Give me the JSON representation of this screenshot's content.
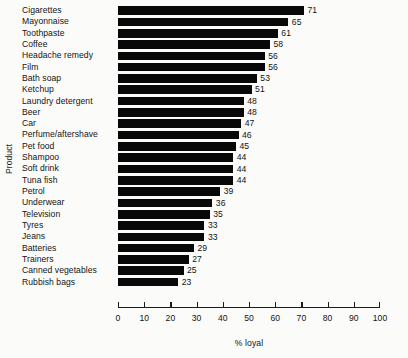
{
  "chart_data": {
    "type": "bar",
    "orientation": "horizontal",
    "title": "",
    "xlabel": "% loyal",
    "ylabel": "Product",
    "xlim": [
      0,
      100
    ],
    "xticks": [
      0,
      10,
      20,
      30,
      40,
      50,
      60,
      70,
      80,
      90,
      100
    ],
    "grid": false,
    "legend": null,
    "bar_color": "#080808",
    "background_color": "#fbfbfa",
    "categories": [
      "Cigarettes",
      "Mayonnaise",
      "Toothpaste",
      "Coffee",
      "Headache remedy",
      "Film",
      "Bath soap",
      "Ketchup",
      "Laundry detergent",
      "Beer",
      "Car",
      "Perfume/aftershave",
      "Pet food",
      "Shampoo",
      "Soft drink",
      "Tuna fish",
      "Petrol",
      "Underwear",
      "Television",
      "Tyres",
      "Jeans",
      "Batteries",
      "Trainers",
      "Canned vegetables",
      "Rubbish bags"
    ],
    "values": [
      71,
      65,
      61,
      58,
      56,
      56,
      53,
      51,
      48,
      48,
      47,
      46,
      45,
      44,
      44,
      44,
      39,
      36,
      35,
      33,
      33,
      29,
      27,
      25,
      23
    ],
    "value_labels": [
      "71",
      "65",
      "61",
      "58",
      "56",
      "56",
      "53",
      "51",
      "48",
      "48",
      "47",
      "46",
      "45",
      "44",
      "44",
      "44",
      "39",
      "36",
      "35",
      "33",
      "33",
      "29",
      "27",
      "25",
      "23"
    ],
    "xtick_labels": [
      "0",
      "10",
      "20",
      "30",
      "40",
      "50",
      "60",
      "70",
      "80",
      "90",
      "100"
    ]
  }
}
